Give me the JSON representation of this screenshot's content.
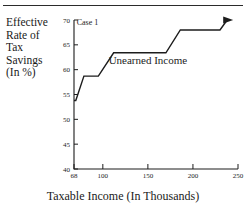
{
  "figure": {
    "top_rule": true,
    "background": "#ffffff",
    "ink_color": "#1c1c1c"
  },
  "axis_titles": {
    "y_lines": [
      "Effective",
      "Rate of",
      "Tax",
      "Savings",
      "(In %)"
    ],
    "x_title": "Taxable Income (In Thousands)"
  },
  "annotations": [
    {
      "text": "Case 1",
      "x": 83,
      "y": 69.0,
      "size": 8
    },
    {
      "text": "Unearned Income",
      "x": 150,
      "y": 61.2,
      "size": 11
    }
  ],
  "chart_data": {
    "type": "line",
    "title": "",
    "subtitle": "",
    "xlabel": "Taxable Income (In Thousands)",
    "ylabel": "Effective Rate of Tax Savings (In %)",
    "xlim": [
      68,
      250
    ],
    "ylim": [
      40,
      70
    ],
    "xticks": [
      68,
      100,
      150,
      200,
      250
    ],
    "xtick_labels": [
      "68",
      "100",
      "150",
      "200",
      "250"
    ],
    "yticks": [
      40,
      45,
      50,
      55,
      60,
      65,
      70
    ],
    "ytick_labels": [
      "40",
      "45",
      "50",
      "55",
      "60",
      "65",
      "70"
    ],
    "grid": false,
    "legend": false,
    "legend_position": "none",
    "arrow_at_end": true,
    "series": [
      {
        "name": "Unearned Income",
        "step_like": true,
        "x": [
          68,
          70,
          79,
          95,
          112,
          128,
          170,
          186,
          230,
          238
        ],
        "y": [
          53.8,
          53.8,
          58.7,
          58.7,
          63.4,
          63.4,
          63.4,
          68.0,
          68.0,
          70.0
        ]
      }
    ]
  }
}
